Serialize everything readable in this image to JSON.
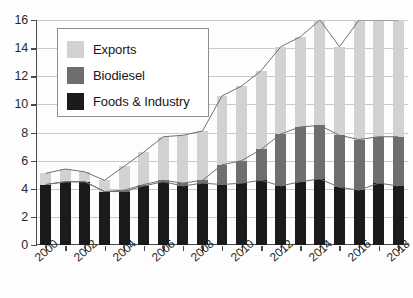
{
  "chart_data": {
    "type": "bar",
    "stacked": true,
    "title": "",
    "subtitle": "",
    "xlabel": "",
    "ylabel": "",
    "ylim": [
      0,
      16
    ],
    "ytick_values": [
      0,
      2,
      4,
      6,
      8,
      10,
      12,
      14,
      16
    ],
    "ytick_labels": [
      "0",
      "2",
      "4",
      "6",
      "8",
      "10",
      "12",
      "14",
      "16"
    ],
    "grid": true,
    "legend_position": "upper-left",
    "categories": [
      "2000",
      "2001",
      "2002",
      "2003",
      "2004",
      "2005",
      "2006",
      "2007",
      "2008",
      "2009",
      "2010",
      "2011",
      "2012",
      "2013",
      "2014",
      "2015",
      "2016",
      "2017",
      "2018"
    ],
    "xtick_labels_shown": [
      "2000",
      "2002",
      "2004",
      "2006",
      "2008",
      "2010",
      "2012",
      "2014",
      "2016",
      "2018"
    ],
    "series": [
      {
        "name": "Foods & Industry",
        "color": "#1b1b1b",
        "values": [
          4.3,
          4.5,
          4.5,
          3.8,
          3.8,
          4.2,
          4.5,
          4.2,
          4.4,
          4.3,
          4.4,
          4.6,
          4.2,
          4.5,
          4.7,
          4.1,
          3.9,
          4.4,
          4.2
        ]
      },
      {
        "name": "Biodiesel",
        "color": "#6e6e6e",
        "values": [
          0.0,
          0.0,
          0.0,
          0.0,
          0.1,
          0.1,
          0.1,
          0.2,
          0.2,
          1.4,
          1.6,
          2.2,
          3.7,
          3.9,
          3.8,
          3.7,
          3.6,
          3.3,
          3.5
        ]
      },
      {
        "name": "Exports",
        "color": "#d2d2d2",
        "values": [
          0.8,
          0.9,
          0.7,
          0.8,
          1.7,
          2.3,
          3.1,
          3.4,
          3.5,
          4.9,
          5.3,
          5.6,
          6.2,
          6.4,
          7.5,
          6.3,
          8.5,
          8.3,
          8.3
        ]
      }
    ],
    "totals": [
      5.1,
      5.4,
      5.2,
      4.6,
      5.6,
      6.6,
      7.7,
      7.8,
      8.1,
      10.6,
      11.3,
      12.4,
      14.1,
      14.8,
      16.0,
      14.1,
      16.0,
      16.0,
      16.0
    ],
    "connector_lines": [
      {
        "name": "Foods & Industry top",
        "values": [
          4.3,
          4.5,
          4.5,
          3.8,
          3.8,
          4.2,
          4.5,
          4.2,
          4.4,
          4.3,
          4.4,
          4.6,
          4.2,
          4.5,
          4.7,
          4.1,
          3.9,
          4.4,
          4.2
        ]
      },
      {
        "name": "Foods & Industry + Biodiesel top",
        "values": [
          4.3,
          4.5,
          4.5,
          3.8,
          3.9,
          4.3,
          4.6,
          4.4,
          4.6,
          5.7,
          6.0,
          6.8,
          7.9,
          8.4,
          8.5,
          7.8,
          7.5,
          7.7,
          7.7
        ]
      },
      {
        "name": "Total top",
        "values": [
          5.1,
          5.4,
          5.2,
          4.6,
          5.6,
          6.6,
          7.7,
          7.8,
          8.1,
          10.6,
          11.3,
          12.4,
          14.1,
          14.8,
          16.0,
          14.1,
          16.0,
          16.0,
          16.0
        ]
      }
    ]
  },
  "legend": {
    "items": [
      {
        "label": "Exports",
        "color": "#d2d2d2",
        "swatch": "sw-exports"
      },
      {
        "label": "Biodiesel",
        "color": "#6e6e6e",
        "swatch": "sw-bio"
      },
      {
        "label": "Foods & Industry",
        "color": "#1b1b1b",
        "swatch": "sw-foods"
      }
    ]
  },
  "colors": {
    "exports": "#d2d2d2",
    "biodiesel": "#6e6e6e",
    "foods_industry": "#1b1b1b",
    "axis": "#4a4a4a",
    "grid": "#c9c9c9",
    "background": "#fdfdfd"
  }
}
